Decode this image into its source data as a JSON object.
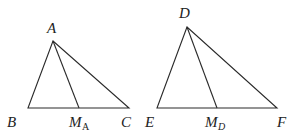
{
  "figure": {
    "triangles": [
      {
        "name": "triangle-ABC",
        "vertices": {
          "A": {
            "label": "A",
            "x": 53,
            "y": 41
          },
          "B": {
            "label": "B",
            "x": 28,
            "y": 108
          },
          "C": {
            "label": "C",
            "x": 129,
            "y": 108
          }
        },
        "midpoint": {
          "label_main": "M",
          "label_sub": "A",
          "x": 79,
          "y": 108
        },
        "median": "A to M_A"
      },
      {
        "name": "triangle-DEF",
        "vertices": {
          "D": {
            "label": "D",
            "x": 187,
            "y": 27
          },
          "E": {
            "label": "E",
            "x": 157,
            "y": 108
          },
          "F": {
            "label": "F",
            "x": 277,
            "y": 108
          }
        },
        "midpoint": {
          "label_main": "M",
          "label_sub": "D",
          "x": 217,
          "y": 108
        },
        "median": "D to M_D"
      }
    ],
    "labels": {
      "A": "A",
      "B": "B",
      "C": "C",
      "M_A_main": "M",
      "M_A_sub": "A",
      "D": "D",
      "E": "E",
      "F": "F",
      "M_D_main": "M",
      "M_D_sub": "D"
    },
    "stroke_color": "#2a2a2a"
  }
}
